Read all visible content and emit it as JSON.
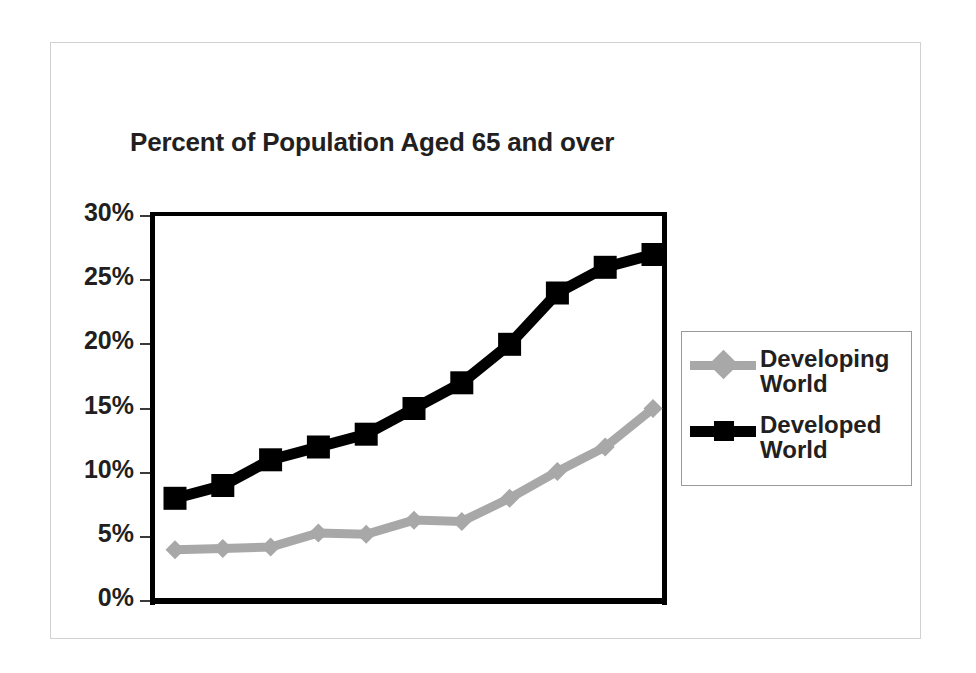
{
  "chart_data": {
    "type": "line",
    "title": "Percent of Population Aged 65 and over",
    "xlabel": "",
    "ylabel": "",
    "ylim": [
      0,
      30
    ],
    "ytick_labels": [
      "30%",
      "25%",
      "20%",
      "15%",
      "10%",
      "5%",
      "0%"
    ],
    "ytick_values": [
      30,
      25,
      20,
      15,
      10,
      5,
      0
    ],
    "grid": true,
    "legend_position": "right",
    "x": [
      1,
      2,
      3,
      4,
      5,
      6,
      7,
      8,
      9,
      10,
      11
    ],
    "series": [
      {
        "name": "Developing World",
        "color": "#a8a8a8",
        "marker": "diamond",
        "values": [
          4.0,
          4.1,
          4.2,
          5.3,
          5.2,
          6.3,
          6.2,
          8.0,
          10.1,
          12.0,
          15.0
        ]
      },
      {
        "name": "Developed World",
        "color": "#000000",
        "marker": "square",
        "values": [
          8.0,
          9.0,
          11.0,
          12.0,
          13.0,
          15.0,
          17.0,
          20.0,
          24.0,
          26.0,
          27.0
        ]
      }
    ]
  },
  "chart": {
    "title": "Percent of Population Aged 65 and over"
  },
  "axis": {
    "ticks": [
      {
        "label": "30%",
        "value": 30
      },
      {
        "label": "25%",
        "value": 25
      },
      {
        "label": "20%",
        "value": 20
      },
      {
        "label": "15%",
        "value": 15
      },
      {
        "label": "10%",
        "value": 10
      },
      {
        "label": "5%",
        "value": 5
      },
      {
        "label": "0%",
        "value": 0
      }
    ]
  },
  "legend": {
    "items": [
      {
        "label": "Developing World",
        "color": "#a8a8a8",
        "marker": "diamond-icon"
      },
      {
        "label": "Developed World",
        "color": "#000000",
        "marker": "square-icon"
      }
    ]
  },
  "colors": {
    "developing": "#a8a8a8",
    "developed": "#000000",
    "text": "#231f20",
    "gridline": "#8c8c8c",
    "frame": "#d2d2d2"
  }
}
